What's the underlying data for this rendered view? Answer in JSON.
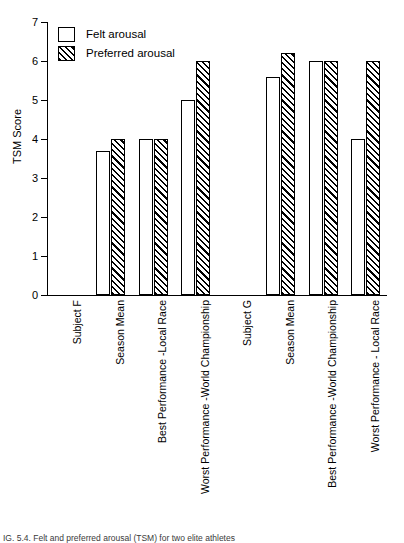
{
  "chart_data": {
    "type": "bar",
    "title": "",
    "xlabel": "",
    "ylabel": "TSM Score",
    "ylim": [
      0,
      7
    ],
    "yticks": [
      0,
      1,
      2,
      3,
      4,
      5,
      6,
      7
    ],
    "grid": false,
    "legend_position": "top-left",
    "categories": [
      "Subject F",
      "Season Mean",
      "Best Performance -Local Race",
      "Worst Performance -World Championship",
      "Subject G",
      "Season Mean",
      "Best Performance -World Championship",
      "Worst Performance - Local Race"
    ],
    "series": [
      {
        "name": "Felt arousal",
        "values": [
          null,
          3.7,
          4.0,
          5.0,
          null,
          5.6,
          6.0,
          4.0
        ]
      },
      {
        "name": "Preferred arousal",
        "values": [
          null,
          4.0,
          4.0,
          6.0,
          null,
          6.2,
          6.0,
          6.0
        ]
      }
    ]
  },
  "legend": {
    "items": [
      {
        "label": "Felt arousal",
        "swatch": "empty"
      },
      {
        "label": "Preferred arousal",
        "swatch": "hatched"
      }
    ]
  },
  "caption": {
    "text": "IG. 5.4. Felt and preferred arousal (TSM) for two elite athletes"
  }
}
